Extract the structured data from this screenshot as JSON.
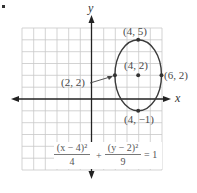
{
  "diagram": {
    "type": "coordinate-graph-ellipse",
    "axes": {
      "x_label": "x",
      "y_label": "y",
      "x_range": [
        -6,
        6
      ],
      "y_range": [
        -6,
        6
      ],
      "grid": true
    },
    "ellipse": {
      "center": [
        4,
        2
      ],
      "semi_axis_x": 2,
      "semi_axis_y": 3
    },
    "points": [
      {
        "coords": [
          4,
          5
        ],
        "label": "(4, 5)"
      },
      {
        "coords": [
          4,
          2
        ],
        "label": "(4, 2)"
      },
      {
        "coords": [
          6,
          2
        ],
        "label": "(6, 2)"
      },
      {
        "coords": [
          2,
          2
        ],
        "label": "(2, 2)"
      },
      {
        "coords": [
          4,
          -1
        ],
        "label": "(4, −1)"
      }
    ],
    "equation": {
      "term1_num": "(x − 4)²",
      "term1_den": "4",
      "plus": "+",
      "term2_num": "(y − 2)²",
      "term2_den": "9",
      "equals": "= 1"
    },
    "colors": {
      "grid": "#c8c8c8",
      "axis": "#222222",
      "curve": "#3a3a3a",
      "text": "#4a4a4a"
    }
  }
}
